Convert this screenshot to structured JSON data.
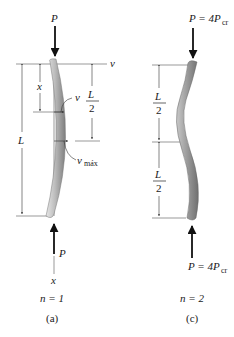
{
  "figure_a": {
    "load_top": "P",
    "load_bottom": "P",
    "deflection_axis": "v",
    "position_label": "x",
    "deflection_label": "v",
    "max_deflection_label": "v",
    "max_deflection_sub": "máx",
    "length_label": "L",
    "half_num": "L",
    "half_den": "2",
    "axis_label": "x",
    "mode": "n = 1",
    "caption": "(a)"
  },
  "figure_c": {
    "load_top": "P = 4P",
    "load_top_sub": "cr",
    "load_bottom": "P = 4P",
    "load_bottom_sub": "cr",
    "upper_half_num": "L",
    "upper_half_den": "2",
    "lower_half_num": "L",
    "lower_half_den": "2",
    "mode": "n = 2",
    "caption": "(c)"
  },
  "colors": {
    "column_fill": "#9a9a9a",
    "column_highlight": "#d8d8d8",
    "line": "#333333"
  }
}
